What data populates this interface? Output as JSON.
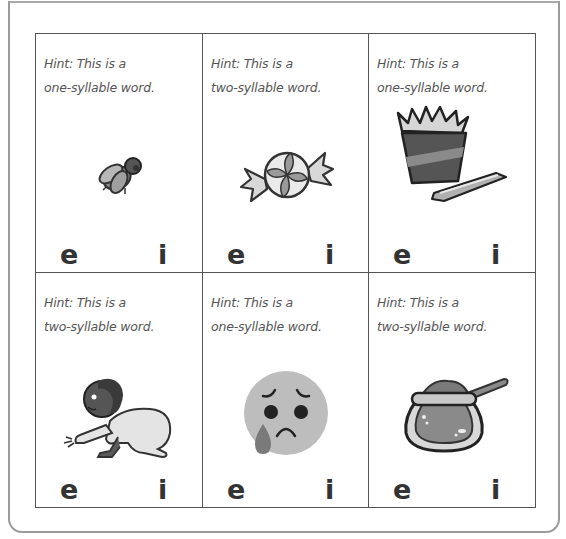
{
  "worksheet": {
    "cards": [
      {
        "hint_line1": "Hint: This is a",
        "hint_line2": "one-syllable word.",
        "picture": "fly-icon",
        "choices": [
          "e",
          "i"
        ]
      },
      {
        "hint_line1": "Hint: This is a",
        "hint_line2": "two-syllable word.",
        "picture": "candy-icon",
        "choices": [
          "e",
          "i"
        ]
      },
      {
        "hint_line1": "Hint: This is a",
        "hint_line2": "one-syllable word.",
        "picture": "chips-and-chip-icon",
        "choices": [
          "e",
          "i"
        ]
      },
      {
        "hint_line1": "Hint: This is a",
        "hint_line2": "two-syllable word.",
        "picture": "crawling-baby-icon",
        "choices": [
          "e",
          "i"
        ]
      },
      {
        "hint_line1": "Hint: This is a",
        "hint_line2": "one-syllable word.",
        "picture": "sad-crying-face-icon",
        "choices": [
          "e",
          "i"
        ]
      },
      {
        "hint_line1": "Hint: This is a",
        "hint_line2": "two-syllable word.",
        "picture": "honey-pot-icon",
        "choices": [
          "e",
          "i"
        ]
      }
    ]
  },
  "colors": {
    "frame": "#9a9a9a",
    "grid_line": "#555555",
    "hint_text": "#555555",
    "letter": "#333333"
  }
}
